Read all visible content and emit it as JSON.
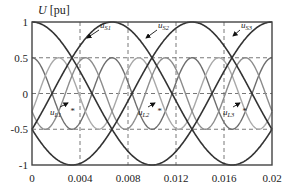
{
  "chart_data": {
    "type": "line",
    "title": "",
    "xlabel": "",
    "ylabel": "U [pu]",
    "xlim": [
      0,
      0.02
    ],
    "ylim": [
      -1,
      1
    ],
    "grid": true,
    "grid_style": "dashed",
    "x_ticks": [
      "0",
      "0.004",
      "0.008",
      "0.012",
      "0.016",
      "0.02"
    ],
    "x_tick_values": [
      0,
      0.004,
      0.008,
      0.012,
      0.016,
      0.02
    ],
    "y_ticks": [
      "1",
      "0.5",
      "0",
      "-0.5",
      "-1"
    ],
    "y_tick_values": [
      1,
      0.5,
      0,
      -0.5,
      -1
    ],
    "legend": null,
    "series": [
      {
        "name": "uS1",
        "label_main": "u",
        "label_sub": "S1",
        "color": "#333333",
        "amplitude": 1.0,
        "period": 0.02,
        "phase_deg": 0,
        "x": [
          0,
          0.002,
          0.004,
          0.006,
          0.008,
          0.01,
          0.012,
          0.014,
          0.016,
          0.018,
          0.02
        ],
        "values": [
          1,
          0.81,
          0.31,
          -0.31,
          -0.81,
          -1,
          -0.81,
          -0.31,
          0.31,
          0.81,
          1
        ]
      },
      {
        "name": "uS2",
        "label_main": "u",
        "label_sub": "S2",
        "color": "#333333",
        "amplitude": 1.0,
        "period": 0.02,
        "phase_deg": -120,
        "x": [
          0,
          0.002,
          0.004,
          0.006,
          0.008,
          0.01,
          0.012,
          0.014,
          0.016,
          0.018,
          0.02
        ],
        "values": [
          -0.5,
          0.1,
          0.67,
          0.98,
          0.91,
          0.5,
          -0.1,
          -0.67,
          -0.98,
          -0.91,
          -0.5
        ]
      },
      {
        "name": "uS3",
        "label_main": "u",
        "label_sub": "S3",
        "color": "#333333",
        "amplitude": 1.0,
        "period": 0.02,
        "phase_deg": 120,
        "x": [
          0,
          0.002,
          0.004,
          0.006,
          0.008,
          0.01,
          0.012,
          0.014,
          0.016,
          0.018,
          0.02
        ],
        "values": [
          -0.5,
          -0.91,
          -0.98,
          -0.67,
          -0.1,
          0.5,
          0.91,
          0.98,
          0.67,
          0.1,
          -0.5
        ]
      },
      {
        "name": "uL1",
        "label_main": "u",
        "label_sub": "L1",
        "color": "#6e6e6e",
        "amplitude": 0.5,
        "period": 0.00667,
        "phase_deg": 0,
        "x": [
          0,
          0.00167,
          0.00333,
          0.005,
          0.00667,
          0.00833,
          0.01,
          0.01167,
          0.01333,
          0.015,
          0.01667,
          0.01833,
          0.02
        ],
        "values": [
          0.5,
          0,
          -0.5,
          0,
          0.5,
          0,
          -0.5,
          0,
          0.5,
          0,
          -0.5,
          0,
          0.5
        ]
      },
      {
        "name": "uL2",
        "label_main": "u",
        "label_sub": "L2",
        "color": "#a8a8a8",
        "amplitude": 0.5,
        "period": 0.00667,
        "phase_deg": -120,
        "x": [
          0,
          0.00222,
          0.00444,
          0.00667,
          0.00889,
          0.01111,
          0.01333,
          0.01556,
          0.01778,
          0.02
        ],
        "values": [
          -0.25,
          0.5,
          -0.5,
          -0.25,
          0.5,
          -0.5,
          -0.25,
          0.5,
          -0.5,
          -0.25
        ]
      },
      {
        "name": "uL3",
        "label_main": "u",
        "label_sub": "L3",
        "color": "#8c8c8c",
        "amplitude": 0.5,
        "period": 0.00667,
        "phase_deg": 120,
        "x": [
          0,
          0.00111,
          0.00333,
          0.00556,
          0.00778,
          0.01,
          0.01222,
          0.01444,
          0.01667,
          0.01889,
          0.02
        ],
        "values": [
          -0.25,
          -0.5,
          0.5,
          -0.5,
          0.5,
          -0.5,
          0.5,
          -0.5,
          0.5,
          -0.5,
          -0.25
        ]
      }
    ],
    "annotations": [
      {
        "text_main": "u",
        "text_sub": "S1",
        "x_px": 100,
        "y_px": 28,
        "arrow_to_px": [
          87,
          38
        ]
      },
      {
        "text_main": "u",
        "text_sub": "S2",
        "x_px": 158,
        "y_px": 28,
        "arrow_to_px": [
          146,
          38
        ]
      },
      {
        "text_main": "u",
        "text_sub": "S3",
        "x_px": 241,
        "y_px": 28,
        "arrow_to_px": [
          233,
          36
        ]
      },
      {
        "text_main": "u",
        "text_sub": "L1",
        "x_px": 50,
        "y_px": 115,
        "arrow_to_px": [
          68,
          103
        ],
        "star": true
      },
      {
        "text_main": "u",
        "text_sub": "L2",
        "x_px": 138,
        "y_px": 115,
        "arrow_to_px": [
          155,
          103
        ],
        "star": true
      },
      {
        "text_main": "u",
        "text_sub": "L3",
        "x_px": 223,
        "y_px": 115,
        "arrow_to_px": [
          240,
          103
        ],
        "star": true
      }
    ]
  },
  "plot_area": {
    "left_px": 32,
    "right_px": 272,
    "top_px": 22,
    "bottom_px": 165
  }
}
